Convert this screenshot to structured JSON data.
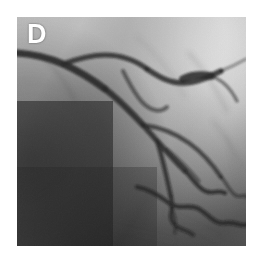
{
  "figure": {
    "panel_label": "D",
    "modality": "coronary-angiogram",
    "label_color": "#ffffff",
    "background_color": "#ffffff"
  },
  "image": {
    "x": 17,
    "y": 17,
    "width": 229,
    "height": 229,
    "tone": {
      "darkest": "#0d0d0d",
      "dark": "#1e1e1e",
      "mid_dark": "#4a4a4a",
      "mid": "#8d8d8d",
      "light": "#c9c9c9",
      "brightest": "#fbfbfb",
      "vessel_dark": "#1a1a1a",
      "vessel_faint": "#5e5e5e"
    },
    "regions": [
      {
        "name": "upper-right-overexposed",
        "tone": "#fbfbfb"
      },
      {
        "name": "left-dark-field",
        "tone": "#141414"
      },
      {
        "name": "lower-left-dark-field",
        "tone": "#1a1a1a"
      },
      {
        "name": "mid-right-gray-field",
        "tone": "#aeaeae"
      },
      {
        "name": "lower-right-gray-field",
        "tone": "#9a9a9a"
      }
    ],
    "vessels": [
      {
        "name": "proximal-main-trunk",
        "path": "M 0 36 C 14 37, 30 40, 46 47 C 62 54, 76 63, 88 72",
        "width": 7.0,
        "opacity": 0.92
      },
      {
        "name": "main-trunk-mid",
        "path": "M 88 72 C 100 81, 112 93, 126 108",
        "width": 6.0,
        "opacity": 0.9
      },
      {
        "name": "main-trunk-distal",
        "path": "M 126 108 C 140 124, 154 140, 168 154",
        "width": 5.2,
        "opacity": 0.88
      },
      {
        "name": "distal-tortuous-1",
        "path": "M 168 154 C 176 162, 180 170, 188 174 C 196 178, 200 172, 208 176",
        "width": 4.2,
        "opacity": 0.82
      },
      {
        "name": "proximal-superior-branch",
        "path": "M 46 47 C 60 42, 74 38, 88 38 C 104 38, 118 43, 130 52",
        "width": 5.0,
        "opacity": 0.85
      },
      {
        "name": "superior-branch-apex",
        "path": "M 130 52 C 142 60, 152 66, 166 66 C 180 66, 192 60, 204 54",
        "width": 5.4,
        "opacity": 0.86
      },
      {
        "name": "apex-bifurcation-node",
        "path": "M 166 62 C 174 58, 184 57, 194 59",
        "width": 7.5,
        "opacity": 0.88
      },
      {
        "name": "upper-right-diagonal",
        "path": "M 194 59 C 206 63, 214 72, 220 84",
        "width": 3.4,
        "opacity": 0.55
      },
      {
        "name": "upper-right-tail",
        "path": "M 204 54 C 214 50, 222 46, 229 42",
        "width": 3.0,
        "opacity": 0.42
      },
      {
        "name": "septal-loop",
        "path": "M 106 54 C 112 66, 118 78, 126 86 C 134 94, 144 96, 150 90",
        "width": 4.0,
        "opacity": 0.6
      },
      {
        "name": "obtuse-marginal-1",
        "path": "M 126 108 C 142 110, 158 116, 172 126 C 186 136, 196 148, 204 160",
        "width": 4.4,
        "opacity": 0.72
      },
      {
        "name": "obtuse-marginal-1-distal",
        "path": "M 204 160 C 210 166, 212 174, 218 178 C 224 182, 228 176, 229 180",
        "width": 3.4,
        "opacity": 0.6
      },
      {
        "name": "mid-diagonal-branch",
        "path": "M 150 132 C 162 142, 172 152, 182 164",
        "width": 3.2,
        "opacity": 0.55
      },
      {
        "name": "descending-branch",
        "path": "M 140 124 C 146 142, 150 162, 154 180",
        "width": 4.6,
        "opacity": 0.8
      },
      {
        "name": "descending-branch-tortuous",
        "path": "M 154 180 C 158 192, 150 198, 156 206 C 162 214, 170 212, 176 218",
        "width": 4.0,
        "opacity": 0.75
      },
      {
        "name": "inferior-serpentine",
        "path": "M 120 170 C 132 172, 144 180, 152 186 C 162 194, 172 186, 182 192 C 192 198, 198 208, 208 206 C 218 204, 224 210, 229 208",
        "width": 4.6,
        "opacity": 0.8
      },
      {
        "name": "inferior-branch-short",
        "path": "M 152 186 C 158 196, 160 206, 158 216",
        "width": 3.0,
        "opacity": 0.58
      },
      {
        "name": "faint-right-field-vessel-1",
        "path": "M 172 36 C 186 52, 200 72, 210 94",
        "width": 2.6,
        "opacity": 0.3
      },
      {
        "name": "faint-right-field-vessel-2",
        "path": "M 196 104 C 208 118, 218 134, 226 150",
        "width": 2.4,
        "opacity": 0.28
      },
      {
        "name": "faint-right-field-vessel-3",
        "path": "M 150 196 C 166 204, 184 212, 200 222",
        "width": 2.4,
        "opacity": 0.26
      },
      {
        "name": "faint-left-branch",
        "path": "M 30 44 C 42 56, 52 70, 58 84",
        "width": 3.0,
        "opacity": 0.3
      }
    ]
  }
}
